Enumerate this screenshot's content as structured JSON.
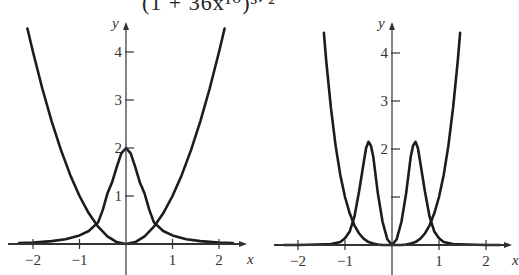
{
  "title_fragment": "(1 + 36x¹⁰)³ᐟ²",
  "chart_data": [
    {
      "type": "line",
      "title": "",
      "xlabel": "x",
      "ylabel": "y",
      "xlim": [
        -2.3,
        2.4
      ],
      "ylim": [
        0,
        4.5
      ],
      "grid": false,
      "x_ticks": [
        -2,
        -1,
        1,
        2
      ],
      "x_tick_labels": [
        "−2",
        "−1",
        "1",
        "2"
      ],
      "y_ticks": [
        1,
        2,
        3,
        4
      ],
      "y_tick_labels": [
        "1",
        "2",
        "3",
        "4"
      ],
      "series": [
        {
          "name": "y = x^2",
          "x": [
            -2.12,
            -2.0,
            -1.8,
            -1.6,
            -1.4,
            -1.2,
            -1.0,
            -0.8,
            -0.6,
            -0.4,
            -0.2,
            0,
            0.2,
            0.4,
            0.6,
            0.8,
            1.0,
            1.2,
            1.4,
            1.6,
            1.8,
            2.0,
            2.12
          ],
          "y": [
            4.49,
            4.0,
            3.24,
            2.56,
            1.96,
            1.44,
            1.0,
            0.64,
            0.36,
            0.16,
            0.04,
            0,
            0.04,
            0.16,
            0.36,
            0.64,
            1.0,
            1.44,
            1.96,
            2.56,
            3.24,
            4.0,
            4.49
          ]
        },
        {
          "name": "curvature 2/(1+4x^2)^(3/2)",
          "x": [
            -2.3,
            -2.0,
            -1.6,
            -1.3,
            -1.0,
            -0.8,
            -0.6,
            -0.5,
            -0.4,
            -0.3,
            -0.2,
            -0.1,
            0,
            0.1,
            0.2,
            0.3,
            0.4,
            0.5,
            0.6,
            0.8,
            1.0,
            1.3,
            1.6,
            2.0,
            2.3
          ],
          "y": [
            0.02,
            0.03,
            0.06,
            0.1,
            0.18,
            0.27,
            0.45,
            0.71,
            1.05,
            1.28,
            1.6,
            1.89,
            2.0,
            1.89,
            1.6,
            1.28,
            1.05,
            0.71,
            0.45,
            0.27,
            0.18,
            0.1,
            0.06,
            0.03,
            0.02
          ]
        }
      ]
    },
    {
      "type": "line",
      "title": "",
      "xlabel": "x",
      "ylabel": "y",
      "xlim": [
        -2.3,
        2.4
      ],
      "ylim": [
        0,
        4.5
      ],
      "grid": false,
      "x_ticks": [
        -2,
        -1,
        1,
        2
      ],
      "x_tick_labels": [
        "−2",
        "−1",
        "1",
        "2"
      ],
      "y_ticks": [
        1,
        2,
        3,
        4
      ],
      "y_tick_labels": [
        "",
        "2",
        "3",
        "4"
      ],
      "series": [
        {
          "name": "y = x^4",
          "x": [
            -1.45,
            -1.4,
            -1.3,
            -1.2,
            -1.1,
            -1.0,
            -0.9,
            -0.8,
            -0.7,
            -0.6,
            -0.5,
            -0.4,
            -0.3,
            -0.2,
            -0.1,
            0,
            0.1,
            0.2,
            0.3,
            0.4,
            0.5,
            0.6,
            0.7,
            0.8,
            0.9,
            1.0,
            1.1,
            1.2,
            1.3,
            1.4,
            1.45
          ],
          "y": [
            4.42,
            3.84,
            2.86,
            2.07,
            1.46,
            1.0,
            0.66,
            0.41,
            0.24,
            0.13,
            0.06,
            0.03,
            0.01,
            0.0,
            0.0,
            0,
            0.0,
            0.0,
            0.01,
            0.03,
            0.06,
            0.13,
            0.24,
            0.41,
            0.66,
            1.0,
            1.46,
            2.07,
            2.86,
            3.84,
            4.42
          ]
        },
        {
          "name": "curvature 12x^2/(1+16x^6)^(3/2)",
          "x": [
            -2.3,
            -2.0,
            -1.6,
            -1.3,
            -1.1,
            -1.0,
            -0.9,
            -0.8,
            -0.7,
            -0.6,
            -0.55,
            -0.5,
            -0.45,
            -0.4,
            -0.3,
            -0.2,
            -0.1,
            0,
            0.1,
            0.2,
            0.3,
            0.4,
            0.45,
            0.5,
            0.55,
            0.6,
            0.7,
            0.8,
            0.9,
            1.0,
            1.1,
            1.3,
            1.6,
            2.0,
            2.3
          ],
          "y": [
            0.0,
            0.0,
            0.01,
            0.02,
            0.06,
            0.14,
            0.28,
            0.59,
            1.12,
            1.73,
            2.02,
            2.15,
            2.07,
            1.85,
            1.07,
            0.48,
            0.12,
            0,
            0.12,
            0.48,
            1.07,
            1.85,
            2.07,
            2.15,
            2.02,
            1.73,
            1.12,
            0.59,
            0.28,
            0.14,
            0.06,
            0.02,
            0.01,
            0.0,
            0.0
          ]
        }
      ]
    }
  ],
  "axis_labels": {
    "x": "x",
    "y": "y"
  }
}
